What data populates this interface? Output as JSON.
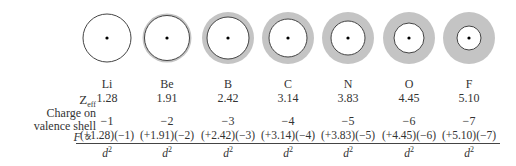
{
  "labels": {
    "zeff": "Z",
    "zeff_sub": "eff",
    "charge_line1": "Charge on",
    "charge_line2": "valence shell",
    "force": "F ∝"
  },
  "denominator": "d",
  "denominator_exp": "2",
  "elements": [
    {
      "symbol": "Li",
      "zeff": "1.28",
      "charge": "−1",
      "numerator": "(+1.28)(−1)",
      "inner_r": 24,
      "halo": 0
    },
    {
      "symbol": "Be",
      "zeff": "1.91",
      "charge": "−2",
      "numerator": "(+1.91)(−2)",
      "inner_r": 22.5,
      "halo": 2
    },
    {
      "symbol": "B",
      "zeff": "2.42",
      "charge": "−3",
      "numerator": "(+2.42)(−3)",
      "inner_r": 21,
      "halo": 5
    },
    {
      "symbol": "C",
      "zeff": "3.14",
      "charge": "−4",
      "numerator": "(+3.14)(−4)",
      "inner_r": 19,
      "halo": 7
    },
    {
      "symbol": "N",
      "zeff": "3.83",
      "charge": "−5",
      "numerator": "(+3.83)(−5)",
      "inner_r": 17,
      "halo": 9
    },
    {
      "symbol": "O",
      "zeff": "4.45",
      "charge": "−6",
      "numerator": "(+4.45)(−6)",
      "inner_r": 15,
      "halo": 11
    },
    {
      "symbol": "F",
      "zeff": "5.10",
      "charge": "−7",
      "numerator": "(+5.10)(−7)",
      "inner_r": 12,
      "halo": 14
    }
  ],
  "colors": {
    "halo": "#c4c4c4",
    "outline": "#444444",
    "nucleus": "#000000"
  }
}
